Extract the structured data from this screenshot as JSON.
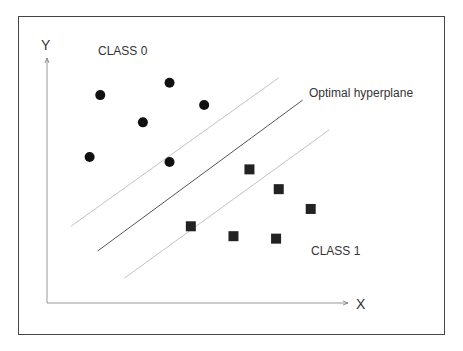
{
  "chart_data": {
    "type": "scatter",
    "title": "",
    "xlabel": "X",
    "ylabel": "Y",
    "annotations": [
      "CLASS 0",
      "CLASS 1",
      "Optimal hyperplane"
    ],
    "series": [
      {
        "name": "CLASS 0",
        "marker": "circle",
        "color": "#111111",
        "points": [
          [
            2.0,
            8.4
          ],
          [
            4.6,
            8.9
          ],
          [
            5.9,
            8.0
          ],
          [
            3.6,
            7.3
          ],
          [
            1.6,
            5.9
          ],
          [
            4.6,
            5.7
          ]
        ]
      },
      {
        "name": "CLASS 1",
        "marker": "square",
        "color": "#222222",
        "points": [
          [
            7.6,
            5.4
          ],
          [
            8.7,
            4.6
          ],
          [
            9.9,
            3.8
          ],
          [
            5.4,
            3.1
          ],
          [
            7.0,
            2.7
          ],
          [
            8.6,
            2.6
          ]
        ]
      }
    ],
    "lines": [
      {
        "name": "margin-upper",
        "style": "light",
        "from": [
          0.9,
          3.1
        ],
        "to": [
          8.7,
          9.1
        ]
      },
      {
        "name": "optimal-hyperplane",
        "style": "solid",
        "from": [
          1.9,
          2.1
        ],
        "to": [
          9.6,
          8.2
        ]
      },
      {
        "name": "margin-lower",
        "style": "light",
        "from": [
          2.9,
          1.0
        ],
        "to": [
          10.6,
          7.0
        ]
      }
    ],
    "xlim": [
      0,
      11.3
    ],
    "ylim": [
      0,
      9.9
    ],
    "grid": false,
    "legend": "none"
  }
}
